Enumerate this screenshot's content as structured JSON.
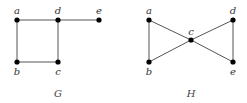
{
  "graphs": [
    {
      "name": "G",
      "caption": {
        "text": "G",
        "x": 58,
        "y": 97
      },
      "nodes": [
        {
          "id": "a",
          "x": 17,
          "y": 20,
          "lx": 17,
          "ly": 14
        },
        {
          "id": "d",
          "x": 58,
          "y": 20,
          "lx": 58,
          "ly": 14
        },
        {
          "id": "e",
          "x": 99,
          "y": 20,
          "lx": 99,
          "ly": 14
        },
        {
          "id": "b",
          "x": 17,
          "y": 62,
          "lx": 17,
          "ly": 75
        },
        {
          "id": "c",
          "x": 58,
          "y": 62,
          "lx": 58,
          "ly": 75
        }
      ],
      "edges": [
        [
          "a",
          "d"
        ],
        [
          "d",
          "e"
        ],
        [
          "a",
          "b"
        ],
        [
          "b",
          "c"
        ],
        [
          "d",
          "c"
        ]
      ]
    },
    {
      "name": "H",
      "caption": {
        "text": "H",
        "x": 191,
        "y": 97
      },
      "nodes": [
        {
          "id": "a",
          "x": 149,
          "y": 20,
          "lx": 149,
          "ly": 14
        },
        {
          "id": "d",
          "x": 233,
          "y": 20,
          "lx": 233,
          "ly": 14
        },
        {
          "id": "c",
          "x": 191,
          "y": 40,
          "lx": 191,
          "ly": 35
        },
        {
          "id": "b",
          "x": 149,
          "y": 62,
          "lx": 149,
          "ly": 75
        },
        {
          "id": "e",
          "x": 233,
          "y": 62,
          "lx": 233,
          "ly": 75
        }
      ],
      "edges": [
        [
          "a",
          "b"
        ],
        [
          "a",
          "c"
        ],
        [
          "b",
          "c"
        ],
        [
          "c",
          "d"
        ],
        [
          "c",
          "e"
        ],
        [
          "d",
          "e"
        ]
      ]
    }
  ]
}
